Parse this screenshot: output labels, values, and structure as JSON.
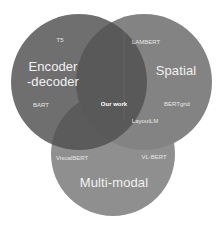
{
  "diagram": {
    "type": "venn",
    "sets": [
      {
        "id": "encoder_decoder",
        "label_line1": "Encoder",
        "label_line2": "-decoder",
        "color": "#5e5e5e",
        "members": [
          "T5",
          "BART"
        ]
      },
      {
        "id": "spatial",
        "label": "Spatial",
        "color": "#838383",
        "members": [
          "LAMBERT",
          "BERTgrid"
        ]
      },
      {
        "id": "multi_modal",
        "label": "Multi-modal",
        "color": "#8f8f8f",
        "members": [
          "VisualBERT",
          "VL-BERT"
        ]
      }
    ],
    "intersections": {
      "spatial_multimodal": "LayoutLM",
      "all_three": "Our work"
    }
  },
  "labels": {
    "encoder_line1": "Encoder",
    "encoder_line2": "-decoder",
    "spatial": "Spatial",
    "multimodal": "Multi-modal",
    "t5": "T5",
    "bart": "BART",
    "lambert": "LAMBERT",
    "bertgrid": "BERTgrid",
    "visualbert": "VisualBERT",
    "vlbert": "VL-BERT",
    "layoutlm": "LayoutLM",
    "our_work": "Our work"
  }
}
